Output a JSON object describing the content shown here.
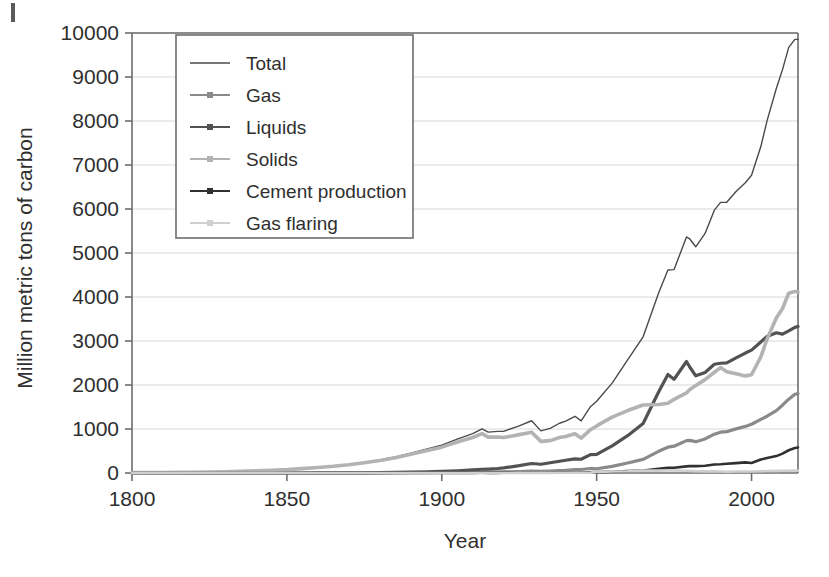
{
  "chart_data": {
    "type": "line",
    "title": "",
    "xlabel": "Year",
    "ylabel": "Million metric tons of carbon",
    "xlim": [
      1800,
      2015
    ],
    "ylim": [
      0,
      10000
    ],
    "xticks": [
      1800,
      1850,
      1900,
      1950,
      2000
    ],
    "yticks": [
      0,
      1000,
      2000,
      3000,
      4000,
      5000,
      6000,
      7000,
      8000,
      9000,
      10000
    ],
    "xtick_labels": [
      "1800",
      "1850",
      "1900",
      "1950",
      "2000"
    ],
    "ytick_labels": [
      "0",
      "1000",
      "2000",
      "3000",
      "4000",
      "5000",
      "6000",
      "7000",
      "8000",
      "9000",
      "10000"
    ],
    "grid": "horizontal",
    "legend_position": "top-left-inside",
    "x": [
      1800,
      1805,
      1810,
      1815,
      1820,
      1825,
      1830,
      1835,
      1840,
      1845,
      1850,
      1855,
      1860,
      1865,
      1870,
      1875,
      1880,
      1885,
      1890,
      1895,
      1900,
      1905,
      1910,
      1913,
      1915,
      1918,
      1920,
      1925,
      1929,
      1932,
      1935,
      1938,
      1940,
      1943,
      1945,
      1948,
      1950,
      1955,
      1960,
      1965,
      1970,
      1973,
      1975,
      1979,
      1980,
      1982,
      1985,
      1988,
      1990,
      1992,
      1995,
      1998,
      2000,
      2003,
      2005,
      2008,
      2010,
      2012,
      2014,
      2015
    ],
    "series": [
      {
        "name": "Total",
        "color": "#4a4a4a",
        "line_width": 1.4,
        "marker": "none",
        "values": [
          8,
          10,
          12,
          15,
          18,
          23,
          29,
          37,
          48,
          62,
          77,
          100,
          127,
          154,
          192,
          239,
          297,
          365,
          449,
          540,
          634,
          769,
          895,
          1002,
          928,
          945,
          947,
          1073,
          1188,
          957,
          1015,
          1131,
          1180,
          1289,
          1184,
          1506,
          1630,
          2043,
          2569,
          3095,
          4092,
          4614,
          4623,
          5366,
          5323,
          5141,
          5444,
          5974,
          6151,
          6154,
          6397,
          6598,
          6766,
          7419,
          8002,
          8740,
          9167,
          9673,
          9855,
          9855
        ]
      },
      {
        "name": "Gas",
        "color": "#8a8a8a",
        "line_width": 3.2,
        "marker": "dot",
        "values": [
          0,
          0,
          0,
          0,
          0,
          0,
          0,
          0,
          0,
          0,
          0,
          0,
          0,
          0,
          1,
          2,
          3,
          5,
          7,
          9,
          11,
          14,
          19,
          22,
          22,
          24,
          26,
          34,
          44,
          39,
          46,
          55,
          60,
          75,
          80,
          103,
          97,
          150,
          227,
          311,
          493,
          587,
          609,
          735,
          740,
          712,
          774,
          882,
          928,
          941,
          1002,
          1059,
          1108,
          1219,
          1291,
          1418,
          1541,
          1677,
          1790,
          1804
        ]
      },
      {
        "name": "Liquids",
        "color": "#525252",
        "line_width": 3.2,
        "marker": "dot",
        "values": [
          0,
          0,
          0,
          0,
          0,
          0,
          0,
          0,
          0,
          0,
          0,
          0,
          1,
          2,
          3,
          5,
          8,
          12,
          18,
          25,
          35,
          49,
          69,
          85,
          90,
          102,
          116,
          167,
          216,
          199,
          233,
          268,
          289,
          321,
          312,
          419,
          423,
          618,
          849,
          1126,
          1839,
          2240,
          2131,
          2534,
          2415,
          2209,
          2285,
          2472,
          2494,
          2501,
          2615,
          2726,
          2793,
          2978,
          3102,
          3188,
          3155,
          3230,
          3310,
          3330
        ]
      },
      {
        "name": "Solids",
        "color": "#b3b3b3",
        "line_width": 3.6,
        "marker": "dot",
        "values": [
          8,
          10,
          12,
          15,
          18,
          23,
          29,
          37,
          48,
          62,
          77,
          100,
          126,
          152,
          188,
          232,
          286,
          348,
          424,
          506,
          588,
          706,
          807,
          895,
          816,
          819,
          805,
          872,
          928,
          719,
          736,
          808,
          831,
          893,
          792,
          984,
          1070,
          1270,
          1419,
          1546,
          1556,
          1584,
          1673,
          1820,
          1894,
          1987,
          2122,
          2289,
          2396,
          2301,
          2258,
          2207,
          2233,
          2639,
          3041,
          3521,
          3738,
          4084,
          4128,
          4108
        ]
      },
      {
        "name": "Cement production",
        "color": "#303030",
        "line_width": 2.6,
        "marker": "dot",
        "values": [
          0,
          0,
          0,
          0,
          0,
          0,
          0,
          0,
          0,
          0,
          0,
          0,
          0,
          0,
          0,
          0,
          0,
          0,
          0,
          1,
          1,
          2,
          3,
          4,
          3,
          3,
          4,
          7,
          10,
          7,
          9,
          12,
          13,
          13,
          9,
          16,
          19,
          30,
          43,
          58,
          95,
          117,
          121,
          151,
          156,
          156,
          166,
          194,
          198,
          209,
          225,
          241,
          226,
          306,
          341,
          384,
          441,
          517,
          568,
          580
        ]
      },
      {
        "name": "Gas flaring",
        "color": "#cfcfcf",
        "line_width": 2.6,
        "marker": "dot",
        "values": [
          0,
          0,
          0,
          0,
          0,
          0,
          0,
          0,
          0,
          0,
          0,
          0,
          0,
          0,
          0,
          0,
          0,
          0,
          0,
          0,
          0,
          0,
          0,
          1,
          1,
          1,
          1,
          2,
          3,
          3,
          3,
          4,
          5,
          6,
          6,
          8,
          23,
          35,
          41,
          55,
          55,
          58,
          56,
          52,
          49,
          40,
          38,
          37,
          35,
          30,
          33,
          34,
          34,
          40,
          44,
          48,
          50,
          52,
          53,
          54
        ]
      }
    ],
    "legend": [
      {
        "label": "Total",
        "color": "#4a4a4a",
        "style": "line"
      },
      {
        "label": "Gas",
        "color": "#8a8a8a",
        "style": "line-marker"
      },
      {
        "label": "Liquids",
        "color": "#525252",
        "style": "line-marker"
      },
      {
        "label": "Solids",
        "color": "#b3b3b3",
        "style": "line-marker"
      },
      {
        "label": "Cement production",
        "color": "#303030",
        "style": "line-marker"
      },
      {
        "label": "Gas flaring",
        "color": "#cfcfcf",
        "style": "line-marker"
      }
    ]
  },
  "axes": {
    "y_title": "Million metric tons of carbon",
    "x_title": "Year"
  }
}
